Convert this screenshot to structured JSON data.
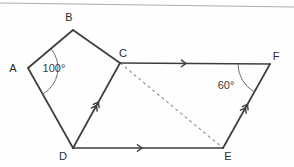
{
  "figure": {
    "type": "geometry-diagram",
    "width": 294,
    "height": 167,
    "background_color": "#fefefe",
    "line_color": "#3d3d3d",
    "dashed_line_color": "#8e8e8e",
    "label_color": "#2b2b2b",
    "vertices": [
      {
        "name": "A",
        "label": "A",
        "x": 28,
        "y": 68,
        "label_x": 13,
        "label_y": 72
      },
      {
        "name": "B",
        "label": "B",
        "x": 73,
        "y": 30,
        "label_x": 69,
        "label_y": 21
      },
      {
        "name": "C",
        "label": "C",
        "x": 120,
        "y": 63,
        "label_x": 123,
        "label_y": 57
      },
      {
        "name": "D",
        "label": "D",
        "x": 73,
        "y": 148,
        "label_x": 63,
        "label_y": 160
      },
      {
        "name": "E",
        "label": "E",
        "x": 223,
        "y": 148,
        "label_x": 228,
        "label_y": 160
      },
      {
        "name": "F",
        "label": "F",
        "x": 270,
        "y": 64,
        "label_x": 276,
        "label_y": 60
      }
    ],
    "solid_edges": [
      {
        "name": "edge-AB",
        "from": "A",
        "to": "B"
      },
      {
        "name": "edge-BC",
        "from": "B",
        "to": "C"
      },
      {
        "name": "edge-AD",
        "from": "A",
        "to": "D"
      },
      {
        "name": "edge-DC",
        "from": "D",
        "to": "C"
      },
      {
        "name": "edge-CF",
        "from": "C",
        "to": "F"
      },
      {
        "name": "edge-DE",
        "from": "D",
        "to": "E"
      },
      {
        "name": "edge-EF",
        "from": "E",
        "to": "F"
      }
    ],
    "dashed_edges": [
      {
        "name": "edge-CE",
        "from": "C",
        "to": "E"
      }
    ],
    "arrow_marks": [
      {
        "name": "arrow-mark-CF",
        "edge": "edge-CF",
        "count": 1,
        "position": 0.44,
        "meaning": "parallel-single"
      },
      {
        "name": "arrow-mark-DE",
        "edge": "edge-DE",
        "count": 1,
        "position": 0.46,
        "meaning": "parallel-single"
      },
      {
        "name": "arrow-mark-DC",
        "edge": "edge-DC",
        "count": 2,
        "position": 0.52,
        "meaning": "parallel-double"
      },
      {
        "name": "arrow-mark-EF",
        "edge": "edge-EF",
        "count": 2,
        "position": 0.5,
        "meaning": "parallel-double"
      }
    ],
    "angles": [
      {
        "name": "angle-at-A",
        "vertex": "A",
        "value": "100°",
        "label_x": 54,
        "label_y": 72,
        "arc_radius": 30
      },
      {
        "name": "angle-at-F",
        "vertex": "F",
        "value": "60°",
        "label_x": 226,
        "label_y": 89,
        "arc_radius": 32
      }
    ]
  }
}
